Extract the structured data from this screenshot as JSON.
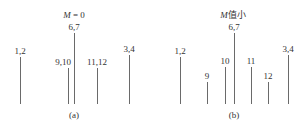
{
  "baseline_y": 104,
  "panels": [
    {
      "id": "a",
      "caption": "(a)",
      "caption_x": 74,
      "title_var": "M",
      "title_rest": " = 0",
      "title_x": 74,
      "title_y": 10,
      "lines": [
        {
          "label": "1,2",
          "x": 20,
          "top": 57
        },
        {
          "label": "9,10",
          "x": 68,
          "top": 68,
          "label_dx": -5
        },
        {
          "label": "6,7",
          "x": 74,
          "top": 33
        },
        {
          "label": "11,12",
          "x": 97,
          "top": 68
        },
        {
          "label": "3,4",
          "x": 129,
          "top": 55
        }
      ]
    },
    {
      "id": "b",
      "caption": "(b)",
      "caption_x": 234,
      "title_var": "M",
      "title_rest": "值小",
      "title_x": 233,
      "title_y": 10,
      "lines": [
        {
          "label": "1,2",
          "x": 180,
          "top": 57
        },
        {
          "label": "9",
          "x": 207,
          "top": 82
        },
        {
          "label": "10",
          "x": 225,
          "top": 67
        },
        {
          "label": "6,7",
          "x": 234,
          "top": 33
        },
        {
          "label": "11",
          "x": 251,
          "top": 67
        },
        {
          "label": "12",
          "x": 268,
          "top": 82
        },
        {
          "label": "3,4",
          "x": 288,
          "top": 55
        }
      ]
    }
  ],
  "colors": {
    "line": "#6a6a6a",
    "text": "#333333"
  }
}
